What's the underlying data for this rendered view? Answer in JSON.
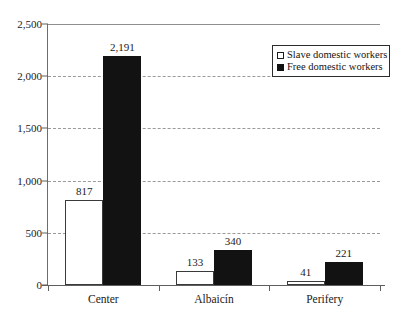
{
  "chart_data": {
    "type": "bar",
    "title": "",
    "subtitle": "",
    "xlabel": "",
    "ylabel": "",
    "categories": [
      "Center",
      "Albaicín",
      "Perifery"
    ],
    "series": [
      {
        "name": "Slave domestic workers",
        "color": "#ffffff",
        "values": [
          817,
          133,
          41
        ],
        "value_labels": [
          "817",
          "133",
          "41"
        ]
      },
      {
        "name": "Free domestic workers",
        "color": "#121212",
        "values": [
          2191,
          340,
          221
        ],
        "value_labels": [
          "2,191",
          "340",
          "221"
        ]
      }
    ],
    "ylim": [
      0,
      2500
    ],
    "yticks": [
      0,
      500,
      1000,
      1500,
      2000,
      2500
    ],
    "ytick_labels": [
      "0",
      "500",
      "1,000",
      "1,500",
      "2,000",
      "2,500"
    ],
    "grid": true,
    "grid_axis": "y",
    "legend_position": "top-right"
  },
  "legend": {
    "items": [
      {
        "label": "Slave domestic workers",
        "marker": "open-square"
      },
      {
        "label": "Free domestic workers",
        "marker": "filled-square"
      }
    ]
  }
}
